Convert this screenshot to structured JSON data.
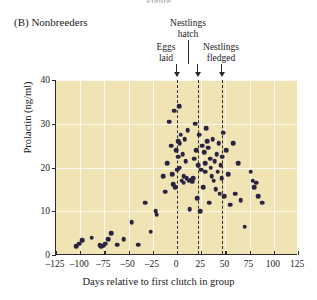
{
  "figure": {
    "cut_title": "Figure",
    "panel_label": "(B) Nonbreeders"
  },
  "annotations": {
    "hatch": "Nestlings\nhatch",
    "hatch_line1": "Nestlings",
    "hatch_line2": "hatch",
    "eggs_line1": "Eggs",
    "eggs_line2": "laid",
    "fledged_line1": "Nestlings",
    "fledged_line2": "fledged"
  },
  "colors": {
    "plot_background": "#f0e3b4",
    "gridline": "#fdfaf0",
    "point": "#2a2342",
    "axis": "#2b2b2b",
    "dashed_marker": "#2e2a1c"
  },
  "chart_data": {
    "type": "scatter",
    "title": "(B) Nonbreeders",
    "xlabel": "Days relative to first clutch in group",
    "ylabel": "Prolactin (ng/ml)",
    "xlim": [
      -125,
      125
    ],
    "ylim": [
      0,
      40
    ],
    "xticks": [
      -125,
      -100,
      -75,
      -50,
      -25,
      0,
      25,
      50,
      75,
      100,
      125
    ],
    "xticklabels": [
      "–125",
      "–100",
      "–75",
      "–50",
      "–25",
      "0",
      "25",
      "50",
      "75",
      "100",
      "125"
    ],
    "yticks": [
      0,
      10,
      20,
      30,
      40
    ],
    "yticklabels": [
      "0",
      "10",
      "20",
      "30",
      "40"
    ],
    "grid": true,
    "legend": null,
    "event_markers": [
      {
        "label": "Eggs laid",
        "x": 0
      },
      {
        "label": "Nestlings hatch",
        "x": 22
      },
      {
        "label": "Nestlings fledged",
        "x": 47
      }
    ],
    "points": [
      [
        -104,
        2.0
      ],
      [
        -101,
        2.6
      ],
      [
        -98,
        3.4
      ],
      [
        -88,
        4.0
      ],
      [
        -80,
        2.2
      ],
      [
        -78,
        2.0
      ],
      [
        -76,
        2.1
      ],
      [
        -74,
        2.6
      ],
      [
        -71,
        3.6
      ],
      [
        -68,
        5.0
      ],
      [
        -62,
        2.4
      ],
      [
        -55,
        3.6
      ],
      [
        -47,
        7.5
      ],
      [
        -40,
        2.4
      ],
      [
        -33,
        12.0
      ],
      [
        -27,
        5.3
      ],
      [
        -22,
        10.0
      ],
      [
        -21,
        9.2
      ],
      [
        -14,
        18.0
      ],
      [
        -12,
        14.5
      ],
      [
        -10,
        21.0
      ],
      [
        -8,
        30.5
      ],
      [
        -6,
        25.0
      ],
      [
        -5,
        18.5
      ],
      [
        -4,
        16.2
      ],
      [
        -3,
        33.0
      ],
      [
        -2,
        15.5
      ],
      [
        -1,
        24.0
      ],
      [
        0,
        19.5
      ],
      [
        1,
        26.0
      ],
      [
        1,
        22.5
      ],
      [
        2,
        34.0
      ],
      [
        3,
        25.5
      ],
      [
        3,
        20.0
      ],
      [
        4,
        27.5
      ],
      [
        5,
        17.0
      ],
      [
        6,
        23.0
      ],
      [
        7,
        18.0
      ],
      [
        7,
        16.5
      ],
      [
        8,
        26.5
      ],
      [
        9,
        21.5
      ],
      [
        10,
        17.5
      ],
      [
        11,
        28.5
      ],
      [
        12,
        17.0
      ],
      [
        13,
        10.5
      ],
      [
        14,
        17.2
      ],
      [
        15,
        17.0
      ],
      [
        16,
        16.8
      ],
      [
        17,
        17.5
      ],
      [
        18,
        22.0
      ],
      [
        19,
        30.0
      ],
      [
        20,
        24.0
      ],
      [
        21,
        13.0
      ],
      [
        22,
        20.5
      ],
      [
        23,
        27.5
      ],
      [
        24,
        10.0
      ],
      [
        25,
        19.5
      ],
      [
        26,
        25.0
      ],
      [
        27,
        15.5
      ],
      [
        28,
        23.5
      ],
      [
        29,
        21.0
      ],
      [
        29,
        19.0
      ],
      [
        30,
        29.0
      ],
      [
        31,
        26.0
      ],
      [
        32,
        24.5
      ],
      [
        33,
        12.0
      ],
      [
        34,
        22.0
      ],
      [
        35,
        20.0
      ],
      [
        36,
        18.0
      ],
      [
        37,
        26.5
      ],
      [
        38,
        17.0
      ],
      [
        39,
        21.5
      ],
      [
        40,
        15.0
      ],
      [
        41,
        23.0
      ],
      [
        42,
        19.0
      ],
      [
        43,
        25.5
      ],
      [
        44,
        14.0
      ],
      [
        45,
        20.5
      ],
      [
        46,
        17.5
      ],
      [
        47,
        22.5
      ],
      [
        48,
        28.0
      ],
      [
        49,
        13.5
      ],
      [
        51,
        24.0
      ],
      [
        53,
        18.5
      ],
      [
        55,
        11.5
      ],
      [
        58,
        25.5
      ],
      [
        60,
        14.0
      ],
      [
        63,
        21.0
      ],
      [
        66,
        12.5
      ],
      [
        70,
        6.5
      ],
      [
        76,
        19.0
      ],
      [
        78,
        17.0
      ],
      [
        80,
        15.5
      ],
      [
        82,
        16.5
      ],
      [
        84,
        13.5
      ],
      [
        88,
        12.0
      ]
    ]
  }
}
